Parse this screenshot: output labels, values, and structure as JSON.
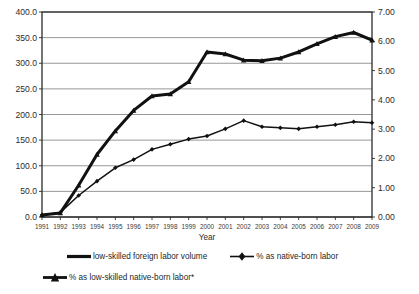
{
  "chart_data": {
    "type": "line",
    "title": "",
    "xlabel": "Year",
    "ylabel": "",
    "grid": true,
    "legend_position": "bottom",
    "x": [
      1991,
      1992,
      1993,
      1994,
      1995,
      1996,
      1997,
      1998,
      1999,
      2000,
      2001,
      2002,
      2003,
      2004,
      2005,
      2006,
      2007,
      2008,
      2009
    ],
    "categories": [
      "1991",
      "1992",
      "1993",
      "1994",
      "1995",
      "1996",
      "1997",
      "1998",
      "1999",
      "2000",
      "2001",
      "2002",
      "2003",
      "2004",
      "2005",
      "2006",
      "2007",
      "2008",
      "2009"
    ],
    "axes": {
      "left": {
        "min": 0.0,
        "max": 400.0,
        "step": 50.0,
        "ticks": [
          "0.0",
          "50.0",
          "100.0",
          "150.0",
          "200.0",
          "250.0",
          "300.0",
          "350.0",
          "400.0"
        ]
      },
      "right": {
        "min": 0.0,
        "max": 7.0,
        "step": 1.0,
        "ticks": [
          "0.00",
          "1.00",
          "2.00",
          "3.00",
          "4.00",
          "5.00",
          "6.00",
          "7.00"
        ]
      }
    },
    "series": [
      {
        "name": "low-skilled foreign labor volume",
        "axis": "left",
        "marker": "none",
        "line_width": 3.0,
        "color": "#111111",
        "values": [
          4,
          8,
          62,
          122,
          168,
          208,
          236,
          240,
          264,
          290,
          300,
          300,
          300,
          300,
          300,
          300,
          300,
          300,
          300
        ]
      },
      {
        "name": "% as native-born labor",
        "axis": "right",
        "marker": "diamond",
        "line_width": 1.4,
        "color": "#111111",
        "values": [
          0.07,
          0.14,
          1.08,
          2.13,
          2.94,
          3.64,
          4.13,
          4.2,
          4.62,
          5.07,
          5.25,
          5.25,
          5.25,
          5.25,
          5.25,
          5.25,
          5.25,
          5.25,
          5.25
        ]
      },
      {
        "name": "% as low-skilled native-born labor*",
        "axis": "right",
        "marker": "triangle",
        "line_width": 2.6,
        "color": "#111111",
        "values": [
          0.08,
          0.16,
          1.1,
          2.15,
          2.96,
          3.66,
          4.15,
          4.22,
          4.64,
          5.1,
          5.28,
          5.28,
          5.28,
          5.28,
          5.28,
          5.28,
          5.28,
          5.28,
          5.28
        ]
      }
    ],
    "plotted_left_axis_lines": {
      "thick_upper": [
        4,
        8,
        62,
        122,
        168,
        208,
        236,
        240,
        264,
        322,
        318,
        306,
        305,
        310,
        322,
        338,
        352,
        360,
        345
      ],
      "thin_lower": [
        4,
        9,
        42,
        70,
        96,
        112,
        132,
        142,
        152,
        158,
        172,
        188,
        176,
        174,
        172,
        176,
        180,
        186,
        184
      ]
    },
    "legend": [
      {
        "label": "low-skilled foreign labor volume",
        "marker": "line"
      },
      {
        "label": "% as native-born labor",
        "marker": "diamond"
      },
      {
        "label": "% as low-skilled native-born labor*",
        "marker": "triangle"
      }
    ]
  }
}
